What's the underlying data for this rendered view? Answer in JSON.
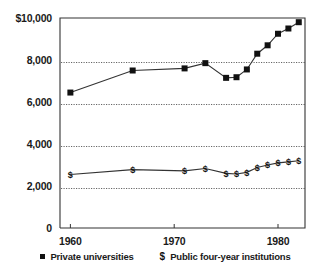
{
  "chart_data": {
    "type": "line",
    "title": "",
    "xlabel": "",
    "ylabel": "",
    "grid": true,
    "legend_position": "bottom",
    "xlim": [
      1959,
      1982.6
    ],
    "ylim": [
      0,
      10000
    ],
    "x_ticks": [
      1960,
      1970,
      1980
    ],
    "x_tick_labels": [
      "1960",
      "1970",
      "1980"
    ],
    "y_ticks": [
      0,
      2000,
      4000,
      6000,
      8000,
      10000
    ],
    "y_tick_labels": [
      "0",
      "2,000",
      "4,000",
      "6,000",
      "8,000",
      "$10,000"
    ],
    "gridline_values": [
      2000,
      4000,
      6000,
      8000
    ],
    "series": [
      {
        "name": "Private universities",
        "marker": "square",
        "x": [
          1960,
          1966,
          1971,
          1973,
          1975,
          1976,
          1977,
          1978,
          1979,
          1980,
          1981,
          1982
        ],
        "values": [
          6450,
          7500,
          7600,
          7850,
          7150,
          7180,
          7550,
          8300,
          8700,
          9250,
          9500,
          9800
        ]
      },
      {
        "name": "Public four-year institutions",
        "marker": "dollar",
        "x": [
          1960,
          1966,
          1971,
          1973,
          1975,
          1976,
          1977,
          1978,
          1979,
          1980,
          1981,
          1982
        ],
        "values": [
          2550,
          2780,
          2720,
          2830,
          2600,
          2570,
          2650,
          2880,
          3000,
          3100,
          3150,
          3200
        ]
      }
    ]
  },
  "legend": {
    "private_marker": "square-marker",
    "private_label": "Private universities",
    "public_marker": "$",
    "public_label": "Public four-year institutions"
  }
}
